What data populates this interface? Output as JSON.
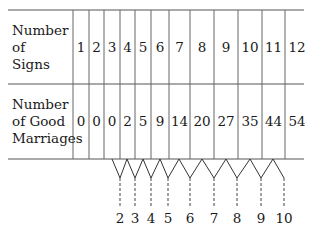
{
  "table": {
    "row_labels": {
      "signs": "Number\nof\nSigns",
      "marriages": "Number\nof Good\nMarriages"
    },
    "signs": [
      "1",
      "2",
      "3",
      "4",
      "5",
      "6",
      "7",
      "8",
      "9",
      "10",
      "11",
      "12"
    ],
    "good_marriages": [
      "0",
      "0",
      "0",
      "2",
      "5",
      "9",
      "14",
      "20",
      "27",
      "35",
      "44",
      "54"
    ]
  },
  "differences": [
    "2",
    "3",
    "4",
    "5",
    "6",
    "7",
    "8",
    "9",
    "10"
  ],
  "colors": {
    "ink": "#1a1a1a",
    "rule": "#555555",
    "background": "#ffffff"
  }
}
